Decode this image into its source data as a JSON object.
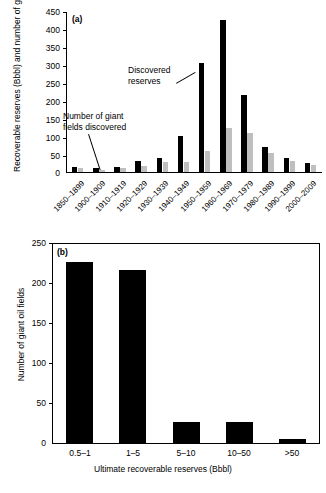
{
  "figure": {
    "panel_a_tag": "(a)",
    "panel_b_tag": "(b)"
  },
  "chart_data": [
    {
      "type": "bar",
      "panel": "(a)",
      "title": "",
      "xlabel": "",
      "ylabel": "Recoverable reserves (Bbbl) and number of giant oil fields",
      "ylim": [
        0,
        450
      ],
      "yticks": [
        0,
        50,
        100,
        150,
        200,
        250,
        300,
        350,
        400,
        450
      ],
      "grid": false,
      "legend": "annotations",
      "categories": [
        "1850–1899",
        "1900–1909",
        "1910–1919",
        "1920–1929",
        "1930–1939",
        "1940–1949",
        "1950–1959",
        "1960–1969",
        "1970–1979",
        "1980–1989",
        "1990–1999",
        "2000–2009"
      ],
      "series": [
        {
          "name": "Discovered reserves",
          "color": "#000000",
          "values": [
            15,
            11,
            14,
            30,
            40,
            101,
            305,
            426,
            216,
            70,
            40,
            26
          ]
        },
        {
          "name": "Number of giant fields discovered",
          "color": "#bfbfbf",
          "values": [
            10,
            6,
            12,
            18,
            28,
            28,
            60,
            124,
            110,
            52,
            31,
            19
          ]
        }
      ],
      "annotations": [
        {
          "text_line1": "Discovered",
          "text_line2": "reserves"
        },
        {
          "text_line1": "Number of giant",
          "text_line2": "fields discovered"
        }
      ]
    },
    {
      "type": "bar",
      "panel": "(b)",
      "title": "",
      "xlabel": "Ultimate recoverable reserves (Bbbl)",
      "ylabel": "Number of giant oil fields",
      "ylim": [
        0,
        250
      ],
      "yticks": [
        0,
        50,
        100,
        150,
        200,
        250
      ],
      "grid": false,
      "categories": [
        "0.5–1",
        "1–5",
        "5–10",
        "10–50",
        ">50"
      ],
      "series": [
        {
          "name": "Number of giant oil fields",
          "color": "#000000",
          "values": [
            226,
            216,
            26,
            26,
            5
          ]
        }
      ]
    }
  ]
}
